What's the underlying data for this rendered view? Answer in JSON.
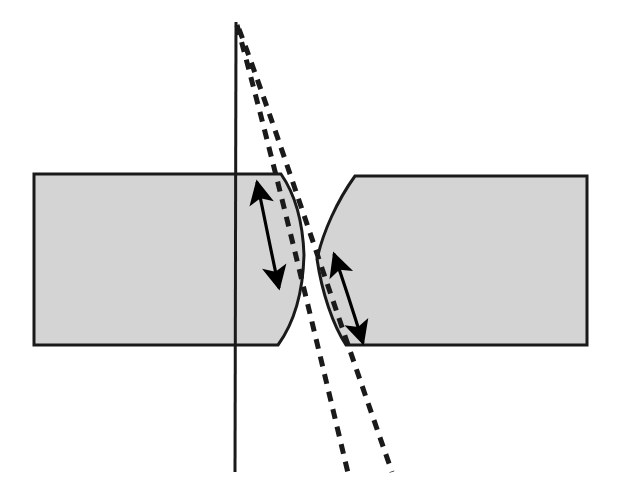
{
  "figure": {
    "background_color": "#ffffff",
    "width": 617,
    "height": 500
  },
  "colors": {
    "block_fill": "#d4d4d4",
    "block_stroke": "#1a1a1a",
    "solid_line": "#1a1a1a",
    "dashed_line": "#1a1a1a",
    "arrow": "#000000"
  },
  "shapes": {
    "left_block": {
      "name": "left-specimen-block",
      "fill": "#d4d4d4",
      "stroke": "#1a1a1a",
      "stroke_width": 3,
      "description": "Rectangular block with convex bulging right edge",
      "path": "M 34 174 L 280 174 C 296 196 302 226 303 254 C 302 290 294 322 278 344 L 34 344 Z"
    },
    "right_block": {
      "name": "right-specimen-block",
      "fill": "#d4d4d4",
      "stroke": "#1a1a1a",
      "stroke_width": 3,
      "description": "Rectangular block with concave notched left edge",
      "path": "M 587 176 L 354 176 C 336 200 322 232 316 258 C 321 292 332 324 345 345 L 587 345 Z"
    }
  },
  "lines": {
    "solid_vertical": {
      "name": "solid-reference-line",
      "x1": 236,
      "y1": 22,
      "x2": 235,
      "y2": 472,
      "stroke": "#1a1a1a",
      "stroke_width": 3
    },
    "dashed_inner": {
      "name": "dashed-crack-path-inner",
      "x1": 238,
      "y1": 26,
      "x2": 348,
      "y2": 473,
      "stroke": "#1a1a1a",
      "stroke_width": 5,
      "dash": "10 8"
    },
    "dashed_outer": {
      "name": "dashed-crack-path-outer",
      "x1": 240,
      "y1": 30,
      "x2": 392,
      "y2": 472,
      "stroke": "#1a1a1a",
      "stroke_width": 5,
      "dash": "10 8"
    }
  },
  "arrows": {
    "left_arrow": {
      "name": "left-displacement-arrow",
      "x1": 257,
      "y1": 181,
      "x2": 280,
      "y2": 290,
      "double_headed": true,
      "stroke": "#000000",
      "stroke_width": 3.2
    },
    "right_arrow": {
      "name": "right-displacement-arrow",
      "x1": 334,
      "y1": 252,
      "x2": 364,
      "y2": 345,
      "double_headed": true,
      "stroke": "#000000",
      "stroke_width": 3.2
    }
  }
}
